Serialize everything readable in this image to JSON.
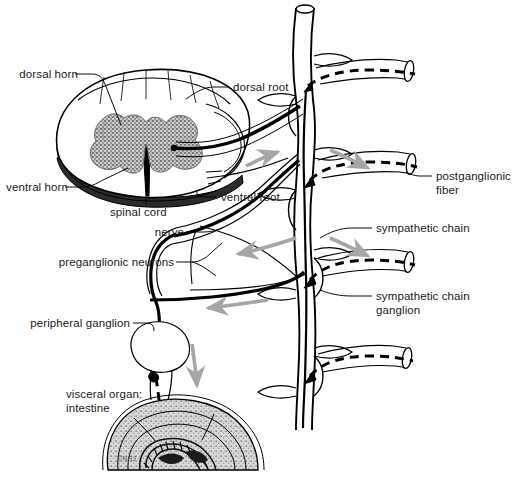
{
  "figure": {
    "type": "anatomical-diagram",
    "background_color": "#ffffff",
    "line_color": "#000000",
    "arrow_color": "#a6a6a6",
    "gray_matter_color": "#9b9b9b",
    "white_matter_color": "#ffffff",
    "ventral_band_color": "#2b2b2b"
  },
  "labels": {
    "dorsal_horn": "dorsal horn",
    "ventral_horn": "ventral horn",
    "spinal_cord": "spinal cord",
    "dorsal_root": "dorsal root",
    "ventral_root": "ventral root",
    "nerve": "nerve",
    "preganglionic_neurons": "preganglionic neurons",
    "peripheral_ganglion": "peripheral ganglion",
    "visceral_organ_line1": "visceral organ:",
    "visceral_organ_line2": "intestine",
    "postganglionic_fiber_line1": "postganglionic",
    "postganglionic_fiber_line2": "fiber",
    "sympathetic_chain": "sympathetic chain",
    "sympathetic_chain_ganglion_line1": "sympathetic chain",
    "sympathetic_chain_ganglion_line2": "ganglion"
  },
  "structures": [
    {
      "name": "spinal-cord-cross-section",
      "kind": "oval"
    },
    {
      "name": "gray-matter-butterfly",
      "kind": "shaded"
    },
    {
      "name": "dorsal-horn",
      "kind": "region"
    },
    {
      "name": "ventral-horn",
      "kind": "region"
    },
    {
      "name": "dorsal-root",
      "kind": "nerve-root"
    },
    {
      "name": "ventral-root",
      "kind": "nerve-root"
    },
    {
      "name": "spinal-nerve",
      "kind": "nerve-trunk"
    },
    {
      "name": "sympathetic-chain",
      "kind": "vertical-trunk"
    },
    {
      "name": "sympathetic-chain-ganglion",
      "kind": "ganglion"
    },
    {
      "name": "postganglionic-fiber",
      "kind": "dashed-fiber"
    },
    {
      "name": "preganglionic-neuron",
      "kind": "solid-fiber"
    },
    {
      "name": "peripheral-ganglion",
      "kind": "ganglion"
    },
    {
      "name": "intestine",
      "kind": "visceral-organ"
    }
  ],
  "flow_arrows": [
    {
      "name": "arrow-ventral-root",
      "direction": "right"
    },
    {
      "name": "arrow-sympathetic-upper",
      "direction": "right"
    },
    {
      "name": "arrow-nerve-mid",
      "direction": "left"
    },
    {
      "name": "arrow-sympathetic-mid",
      "direction": "right"
    },
    {
      "name": "arrow-nerve-lower",
      "direction": "left"
    },
    {
      "name": "arrow-peripheral-down",
      "direction": "down"
    }
  ],
  "credit": "©NRJ"
}
